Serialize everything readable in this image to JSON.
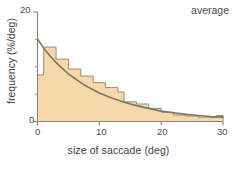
{
  "figure": {
    "background": "#ffffff",
    "annotation": "average"
  },
  "chart_data": {
    "type": "bar",
    "title": "",
    "subtitle": "",
    "annotations": [
      {
        "text": "average",
        "position": "top-right"
      }
    ],
    "xlabel": "size of saccade (deg)",
    "ylabel": "frequency (%/deg)",
    "xlim": [
      0,
      30
    ],
    "ylim": [
      0,
      20
    ],
    "xticks": [
      0,
      10,
      20,
      30
    ],
    "xtick_labels": [
      "0",
      "10",
      "20",
      "30"
    ],
    "yticks": [
      0,
      20
    ],
    "ytick_labels": [
      "0",
      "20"
    ],
    "yminor_ticks": [
      5,
      10,
      15
    ],
    "grid": false,
    "legend": null,
    "bar_fill_color": "#f6d9a8",
    "bar_edge_color": "#8a8275",
    "curve_color": "#7d756a",
    "axis_color": "#8a8275",
    "text_color": "#4a4a4a",
    "bin_width": 1,
    "categories": [
      0.5,
      1.5,
      2.5,
      3.5,
      4.5,
      5.5,
      6.5,
      7.5,
      8.5,
      9.5,
      10.5,
      11.5,
      12.5,
      13.5,
      14.5,
      15.5,
      16.5,
      17.5,
      18.5,
      19.5,
      20.5,
      21.5,
      22.5,
      23.5,
      24.5,
      25.5,
      26.5,
      27.5,
      28.5,
      29.5
    ],
    "values": [
      8.5,
      13.6,
      13.6,
      11.4,
      11.4,
      9.6,
      9.6,
      8.3,
      8.3,
      7.1,
      7.1,
      6.2,
      6.2,
      5.4,
      3.6,
      3.6,
      3.2,
      3.2,
      2.4,
      2.4,
      1.7,
      1.7,
      1.2,
      1.2,
      1.0,
      1.0,
      0.8,
      0.8,
      0.7,
      1.1
    ],
    "series": [
      {
        "name": "histogram",
        "type": "bar",
        "values": [
          8.5,
          13.6,
          13.6,
          11.4,
          11.4,
          9.6,
          9.6,
          8.3,
          8.3,
          7.1,
          7.1,
          6.2,
          6.2,
          5.4,
          3.6,
          3.6,
          3.2,
          3.2,
          2.4,
          2.4,
          1.7,
          1.7,
          1.2,
          1.2,
          1.0,
          1.0,
          0.8,
          0.8,
          0.7,
          1.1
        ]
      },
      {
        "name": "exponential-fit",
        "type": "line",
        "x": [
          0,
          1,
          2,
          3,
          4,
          5,
          6,
          7,
          8,
          9,
          10,
          12,
          14,
          16,
          18,
          20,
          22,
          24,
          26,
          28,
          30
        ],
        "y": [
          15.1,
          13.4,
          12.0,
          10.8,
          9.7,
          8.7,
          7.9,
          7.1,
          6.4,
          5.8,
          5.2,
          4.3,
          3.5,
          2.9,
          2.4,
          1.9,
          1.6,
          1.3,
          1.1,
          0.9,
          0.8
        ]
      }
    ]
  }
}
